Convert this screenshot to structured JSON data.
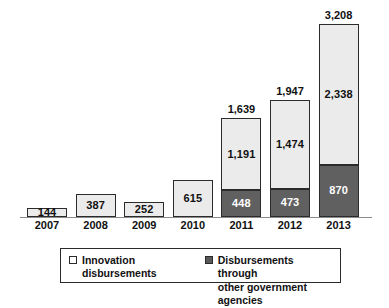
{
  "chart_data": {
    "type": "bar",
    "title": "",
    "subtitle": "",
    "xlabel": "",
    "ylabel": "",
    "stacked": true,
    "grid": false,
    "ylim": [
      0,
      3208
    ],
    "axis_visible": "x-only",
    "categories": [
      "2007",
      "2008",
      "2009",
      "2010",
      "2011",
      "2012",
      "2013"
    ],
    "series": [
      {
        "name": "Innovation disbursements",
        "color": "#ebebeb",
        "values": [
          144,
          387,
          252,
          615,
          1191,
          1474,
          2338
        ],
        "labels": [
          "144",
          "387",
          "252",
          "615",
          "1,191",
          "1,474",
          "2,338"
        ]
      },
      {
        "name": "Disbursements through other government agencies",
        "color": "#606060",
        "values": [
          0,
          0,
          0,
          0,
          448,
          473,
          870
        ],
        "labels": [
          "",
          "",
          "",
          "",
          "448",
          "473",
          "870"
        ]
      }
    ],
    "totals": [
      144,
      387,
      252,
      615,
      1639,
      1947,
      3208
    ],
    "total_labels": [
      "",
      "",
      "",
      "",
      "1,639",
      "1,947",
      "3,208"
    ],
    "legend_position": "bottom"
  },
  "legend": {
    "items": [
      {
        "label": "Innovation disbursements",
        "swatch": "light-square-icon"
      },
      {
        "label": "Disbursements through\nother government agencies",
        "swatch": "dark-square-icon"
      }
    ]
  }
}
